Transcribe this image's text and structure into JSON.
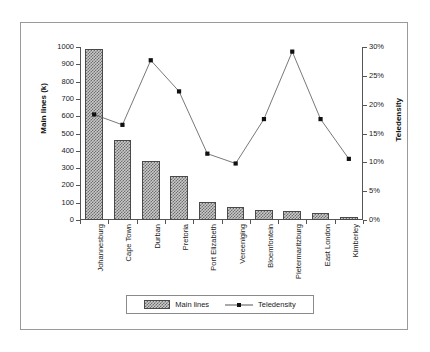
{
  "chart_data": {
    "type": "bar",
    "title": "",
    "subtitle": "",
    "xlabel": "",
    "ylabel": "Main lines (k)",
    "y2label": "Teledensity",
    "grid": false,
    "legend_position": "bottom",
    "categories": [
      "Johannesburg",
      "Cape Town",
      "Durban",
      "Pretoria",
      "Port Elizabeth",
      "Vereeniging",
      "Bloemfontein",
      "Pietermaritzburg",
      "East London",
      "Kimberley"
    ],
    "ylim": [
      0,
      1000
    ],
    "yticks": [
      0,
      100,
      200,
      300,
      400,
      500,
      600,
      700,
      800,
      900,
      1000
    ],
    "ytick_labels": [
      "0",
      "100",
      "200",
      "300",
      "400",
      "500",
      "600",
      "700",
      "800",
      "900",
      "1000"
    ],
    "y2lim": [
      0,
      30
    ],
    "y2ticks": [
      0,
      5,
      10,
      15,
      20,
      25,
      30
    ],
    "y2tick_labels": [
      "0%",
      "5%",
      "10%",
      "15%",
      "20%",
      "25%",
      "30%"
    ],
    "series": [
      {
        "name": "Main lines",
        "type": "bar",
        "axis": "left",
        "values": [
          990,
          460,
          340,
          252,
          105,
          78,
          58,
          55,
          38,
          20
        ]
      },
      {
        "name": "Teledensity",
        "type": "line",
        "axis": "right",
        "values": [
          18.3,
          16.5,
          27.7,
          22.3,
          11.5,
          9.8,
          17.5,
          29.2,
          17.5,
          10.6
        ]
      }
    ]
  },
  "legend": {
    "items": [
      {
        "label": "Main lines"
      },
      {
        "label": "Teledensity"
      }
    ]
  }
}
